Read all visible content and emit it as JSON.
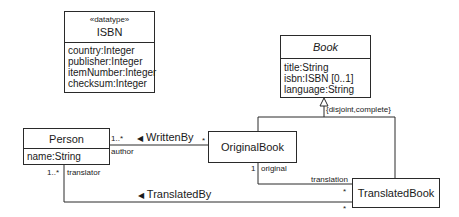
{
  "diagram": {
    "type": "uml-class-diagram",
    "classes": [
      {
        "id": "isbn",
        "stereotype": "«datatype»",
        "name": "ISBN",
        "attributes": [
          "country:Integer",
          "publisher:Integer",
          "itemNumber:Integer",
          "checksum:Integer"
        ]
      },
      {
        "id": "book",
        "name": "Book",
        "abstract": true,
        "attributes": [
          "title:String",
          "isbn:ISBN [0..1]",
          "language:String"
        ]
      },
      {
        "id": "person",
        "name": "Person",
        "attributes": [
          "name:String"
        ]
      },
      {
        "id": "originalbook",
        "name": "OriginalBook"
      },
      {
        "id": "translatedbook",
        "name": "TranslatedBook"
      }
    ],
    "generalization": {
      "constraint": "{disjoint,complete}",
      "parent": "Book",
      "children": [
        "OriginalBook",
        "TranslatedBook"
      ]
    },
    "associations": [
      {
        "name": "WrittenBy",
        "direction_marker": "◀",
        "from": "Person",
        "to": "OriginalBook",
        "from_multiplicity": "1..*",
        "from_role": "author",
        "to_multiplicity": "*"
      },
      {
        "name": "TranslatedBy",
        "direction_marker": "◀",
        "from": "Person",
        "to": "TranslatedBook",
        "from_multiplicity": "1..*",
        "from_role": "translator",
        "to_multiplicity": "*"
      },
      {
        "from": "OriginalBook",
        "to": "TranslatedBook",
        "from_multiplicity": "1",
        "from_role": "original",
        "to_role": "translation",
        "to_multiplicity": "*"
      }
    ]
  }
}
